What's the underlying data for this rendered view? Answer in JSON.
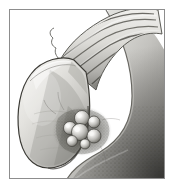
{
  "figure": {
    "medium": "grayscale anatomical line-and-stipple illustration",
    "frame": {
      "border_color": "#8d8d8d",
      "background_color": "#ffffff",
      "outer_background_color": "#ffffff",
      "left": 9,
      "top": 9,
      "width": 154,
      "height": 168
    },
    "palette": {
      "paper_white": "#ffffff",
      "highlight": "#f2f2f0",
      "light_gray": "#d8d8d6",
      "mid_gray": "#b4b3b0",
      "shade_gray": "#8f8e8b",
      "dark_gray": "#5c5b58",
      "outline": "#3a3a38",
      "deep_shadow": "#252523"
    },
    "structures": [
      {
        "id": "liver-mass",
        "label": "Liver",
        "description": "large smooth rounded organ mass occupying the right and lower portion of the frame, graded from light upper-left to dark lower-right",
        "tone_range": [
          "#e6e5e2",
          "#4a4946"
        ]
      },
      {
        "id": "gallbladder-body",
        "label": "Gallbladder (opened)",
        "description": "pear / teardrop shaped sac at left, cut open to reveal the inner mucosal surface",
        "tone_range": [
          "#eceae7",
          "#8a8985"
        ]
      },
      {
        "id": "cystic-duct-folds",
        "label": "Spiral folds of cystic duct",
        "description": "band of transverse ridges running from the gallbladder neck up toward the upper right corner",
        "fold_count": 7
      },
      {
        "id": "stone-cluster",
        "label": "Gallstones",
        "description": "cluster of rounded calculi lying in a dark stippled depression in the gallbladder fundus",
        "stone_count": 7,
        "stones": [
          {
            "cx": 60,
            "cy": 118,
            "r": 6.5,
            "highlight": "#fbfbfa"
          },
          {
            "cx": 72,
            "cy": 108,
            "r": 7.5,
            "highlight": "#fbfbfa"
          },
          {
            "cx": 84,
            "cy": 112,
            "r": 6.0,
            "highlight": "#f6f6f4"
          },
          {
            "cx": 70,
            "cy": 122,
            "r": 8.5,
            "highlight": "#fdfdfc"
          },
          {
            "cx": 84,
            "cy": 126,
            "r": 7.0,
            "highlight": "#f8f8f6"
          },
          {
            "cx": 62,
            "cy": 131,
            "r": 5.5,
            "highlight": "#f4f4f2"
          },
          {
            "cx": 75,
            "cy": 134,
            "r": 5.0,
            "highlight": "#f2f2f0"
          }
        ]
      }
    ],
    "annotations": {
      "visible_text": "",
      "labels_shown": false,
      "caption": ""
    }
  }
}
